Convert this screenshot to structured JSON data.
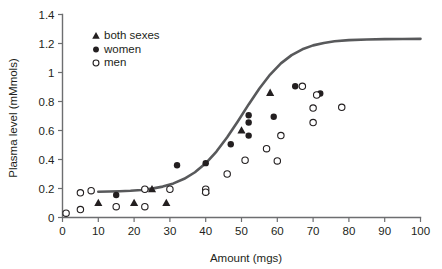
{
  "chart_data": {
    "type": "scatter",
    "title": "",
    "xlabel": "Amount (mgs)",
    "ylabel": "Plasma level (mMmols)",
    "xlim": [
      0,
      100
    ],
    "ylim": [
      0,
      1.4
    ],
    "xticks": [
      0,
      10,
      20,
      30,
      40,
      50,
      60,
      70,
      80,
      90,
      100
    ],
    "xtick_labels": [
      "0",
      "10",
      "20",
      "30",
      "40",
      "50",
      "60",
      "70",
      "80",
      "90",
      "100"
    ],
    "yticks": [
      0,
      0.2,
      0.4,
      0.6,
      0.8,
      1,
      1.2,
      1.4
    ],
    "ytick_labels": [
      "0",
      "0.2",
      "0.4",
      "0.6",
      "0.8",
      "1",
      "1.2",
      "1.4"
    ],
    "grid": false,
    "legend_position": "top-left-inside",
    "colors": {
      "marker": "#231f20",
      "curve": "#58595b",
      "axis": "#6d6e70",
      "background": "#ffffff"
    },
    "series": [
      {
        "name": "both sexes",
        "marker": "triangle-filled",
        "points": [
          {
            "x": 10,
            "y": 0.1
          },
          {
            "x": 20,
            "y": 0.1
          },
          {
            "x": 25,
            "y": 0.195
          },
          {
            "x": 29,
            "y": 0.1
          },
          {
            "x": 40,
            "y": 0.185
          },
          {
            "x": 50,
            "y": 0.6
          },
          {
            "x": 58,
            "y": 0.86
          }
        ]
      },
      {
        "name": "women",
        "marker": "circle-filled",
        "points": [
          {
            "x": 15,
            "y": 0.155
          },
          {
            "x": 32,
            "y": 0.36
          },
          {
            "x": 40,
            "y": 0.375
          },
          {
            "x": 40,
            "y": 0.18
          },
          {
            "x": 47,
            "y": 0.505
          },
          {
            "x": 52,
            "y": 0.705
          },
          {
            "x": 52,
            "y": 0.655
          },
          {
            "x": 52,
            "y": 0.565
          },
          {
            "x": 59,
            "y": 0.695
          },
          {
            "x": 65,
            "y": 0.905
          },
          {
            "x": 72,
            "y": 0.855
          }
        ]
      },
      {
        "name": "men",
        "marker": "circle-open",
        "points": [
          {
            "x": 1,
            "y": 0.03
          },
          {
            "x": 5,
            "y": 0.17
          },
          {
            "x": 5,
            "y": 0.055
          },
          {
            "x": 8,
            "y": 0.185
          },
          {
            "x": 15,
            "y": 0.075
          },
          {
            "x": 23,
            "y": 0.195
          },
          {
            "x": 23,
            "y": 0.075
          },
          {
            "x": 30,
            "y": 0.195
          },
          {
            "x": 40,
            "y": 0.195
          },
          {
            "x": 40,
            "y": 0.175
          },
          {
            "x": 46,
            "y": 0.3
          },
          {
            "x": 51,
            "y": 0.395
          },
          {
            "x": 57,
            "y": 0.475
          },
          {
            "x": 61,
            "y": 0.565
          },
          {
            "x": 60,
            "y": 0.39
          },
          {
            "x": 67,
            "y": 0.905
          },
          {
            "x": 70,
            "y": 0.755
          },
          {
            "x": 70,
            "y": 0.655
          },
          {
            "x": 71,
            "y": 0.845
          },
          {
            "x": 78,
            "y": 0.76
          }
        ]
      }
    ],
    "fit_curve": {
      "name": "logistic fit",
      "points": [
        {
          "x": 10.0,
          "y": 0.178
        },
        {
          "x": 13.0,
          "y": 0.179
        },
        {
          "x": 16.0,
          "y": 0.181
        },
        {
          "x": 19.0,
          "y": 0.184
        },
        {
          "x": 22.0,
          "y": 0.19
        },
        {
          "x": 25.0,
          "y": 0.199
        },
        {
          "x": 28.0,
          "y": 0.213
        },
        {
          "x": 31.0,
          "y": 0.235
        },
        {
          "x": 34.0,
          "y": 0.267
        },
        {
          "x": 37.0,
          "y": 0.312
        },
        {
          "x": 40.0,
          "y": 0.374
        },
        {
          "x": 43.0,
          "y": 0.455
        },
        {
          "x": 46.0,
          "y": 0.553
        },
        {
          "x": 49.0,
          "y": 0.664
        },
        {
          "x": 52.0,
          "y": 0.78
        },
        {
          "x": 55.0,
          "y": 0.89
        },
        {
          "x": 58.0,
          "y": 0.986
        },
        {
          "x": 61.0,
          "y": 1.063
        },
        {
          "x": 64.0,
          "y": 1.12
        },
        {
          "x": 67.0,
          "y": 1.16
        },
        {
          "x": 70.0,
          "y": 1.187
        },
        {
          "x": 73.0,
          "y": 1.204
        },
        {
          "x": 76.0,
          "y": 1.215
        },
        {
          "x": 80.0,
          "y": 1.223
        },
        {
          "x": 85.0,
          "y": 1.228
        },
        {
          "x": 90.0,
          "y": 1.23
        },
        {
          "x": 95.0,
          "y": 1.231
        },
        {
          "x": 100.0,
          "y": 1.232
        }
      ]
    },
    "legend": [
      {
        "label": "both sexes",
        "marker": "triangle-filled"
      },
      {
        "label": "women",
        "marker": "circle-filled"
      },
      {
        "label": "men",
        "marker": "circle-open"
      }
    ]
  }
}
